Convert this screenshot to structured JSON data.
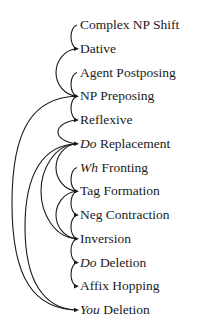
{
  "diagram": {
    "type": "rule-ordering",
    "line_color": "#1a1a1a",
    "nodes": [
      {
        "id": 0,
        "italic": "",
        "text": "Complex NP Shift"
      },
      {
        "id": 1,
        "italic": "",
        "text": "Dative"
      },
      {
        "id": 2,
        "italic": "",
        "text": "Agent Postposing"
      },
      {
        "id": 3,
        "italic": "",
        "text": "NP Preposing"
      },
      {
        "id": 4,
        "italic": "",
        "text": "Reflexive"
      },
      {
        "id": 5,
        "italic": "Do",
        "text": " Replacement"
      },
      {
        "id": 6,
        "italic": "Wh",
        "text": " Fronting"
      },
      {
        "id": 7,
        "italic": "",
        "text": "Tag Formation"
      },
      {
        "id": 8,
        "italic": "",
        "text": "Neg Contraction"
      },
      {
        "id": 9,
        "italic": "",
        "text": "Inversion"
      },
      {
        "id": 10,
        "italic": "Do",
        "text": " Deletion"
      },
      {
        "id": 11,
        "italic": "",
        "text": "Affix Hopping"
      },
      {
        "id": 12,
        "italic": "You",
        "text": " Deletion"
      }
    ],
    "edges": [
      {
        "from": 0,
        "to": 1,
        "x": 71
      },
      {
        "from": 1,
        "to": 3,
        "x": 56
      },
      {
        "from": 2,
        "to": 3,
        "x": 71
      },
      {
        "from": 3,
        "to": 4,
        "x": 71
      },
      {
        "from": 3,
        "to": 12,
        "x": 12
      },
      {
        "from": 4,
        "to": 5,
        "x": 58
      },
      {
        "from": 5,
        "to": 12,
        "x": 25
      },
      {
        "from": 5,
        "to": 9,
        "x": 41
      },
      {
        "from": 5,
        "to": 7,
        "x": 56
      },
      {
        "from": 6,
        "to": 7,
        "x": 71
      },
      {
        "from": 7,
        "to": 8,
        "x": 71
      },
      {
        "from": 7,
        "to": 9,
        "x": 56
      },
      {
        "from": 8,
        "to": 9,
        "x": 71
      },
      {
        "from": 9,
        "to": 10,
        "x": 71
      },
      {
        "from": 10,
        "to": 11,
        "x": 71
      }
    ]
  }
}
